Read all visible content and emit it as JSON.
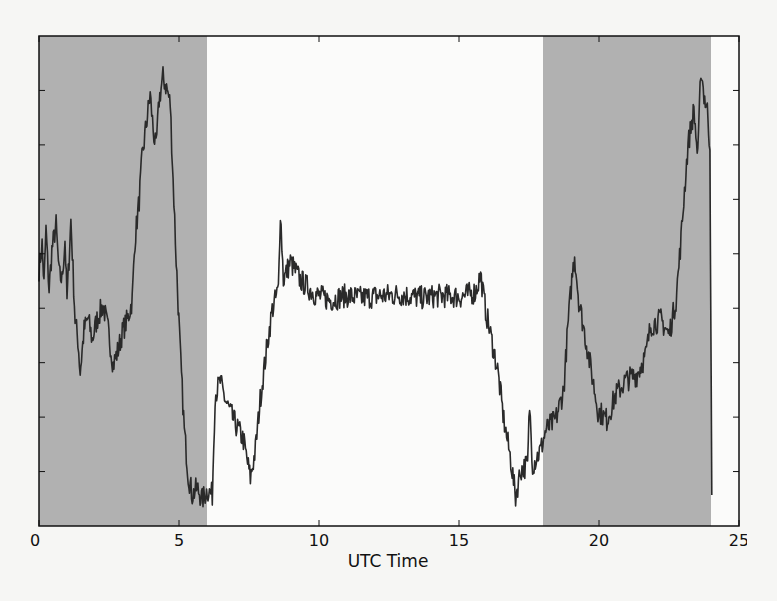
{
  "chart_data": {
    "type": "line",
    "title": "",
    "xlabel": "UTC Time",
    "ylabel": "",
    "xlim": [
      0,
      25
    ],
    "ylim": [
      0,
      9
    ],
    "xticks": [
      0,
      5,
      10,
      15,
      20,
      25
    ],
    "xtick_labels": [
      "0",
      "5",
      "10",
      "15",
      "20",
      "25"
    ],
    "yticks": [
      1,
      2,
      3,
      4,
      5,
      6,
      7,
      8
    ],
    "ytick_labels": [],
    "grid": false,
    "legend": null,
    "colors": {
      "line": "#2a2a2a",
      "shade": "#b1b1b1",
      "background": "#f6f6f4",
      "axes": "#111111"
    },
    "shaded_regions": [
      {
        "x_start": 0,
        "x_end": 6,
        "label": "night"
      },
      {
        "x_start": 18,
        "x_end": 24,
        "label": "night"
      }
    ],
    "noise_amplitude": 0.22,
    "series": [
      {
        "name": "signal",
        "x": [
          0,
          0.11,
          0.18,
          0.25,
          0.36,
          0.46,
          0.61,
          0.72,
          0.82,
          0.93,
          1.0,
          1.14,
          1.29,
          1.39,
          1.47,
          1.61,
          1.75,
          1.9,
          2.07,
          2.29,
          2.47,
          2.65,
          2.83,
          3.0,
          3.18,
          3.33,
          3.43,
          3.58,
          3.68,
          3.83,
          3.97,
          4.08,
          4.18,
          4.29,
          4.43,
          4.58,
          4.69,
          4.79,
          4.9,
          5.04,
          5.19,
          5.33,
          5.47,
          5.65,
          5.83,
          6.01,
          6.19,
          6.29,
          6.47,
          6.65,
          6.94,
          7.3,
          7.55,
          7.73,
          7.9,
          8.15,
          8.33,
          8.55,
          8.62,
          8.73,
          8.98,
          9.33,
          9.87,
          10.41,
          10.94,
          11.48,
          12.2,
          12.91,
          13.63,
          14.34,
          15.06,
          15.59,
          15.77,
          15.95,
          16.13,
          16.38,
          16.6,
          16.85,
          17.02,
          17.2,
          17.45,
          17.52,
          17.63,
          17.92,
          18.1,
          18.45,
          18.74,
          18.88,
          19.03,
          19.13,
          19.28,
          19.53,
          19.78,
          19.96,
          20.28,
          20.6,
          20.96,
          21.35,
          21.67,
          21.85,
          22.21,
          22.5,
          22.75,
          22.93,
          23.03,
          23.18,
          23.39,
          23.53,
          23.64,
          23.75,
          23.89,
          23.96,
          24.03
        ],
        "y": [
          4.71,
          5.17,
          4.43,
          5.44,
          4.34,
          5.07,
          5.53,
          4.61,
          4.52,
          5.26,
          4.15,
          5.63,
          3.79,
          3.42,
          2.83,
          3.6,
          3.82,
          3.42,
          3.79,
          4.06,
          3.6,
          2.96,
          3.24,
          3.6,
          3.82,
          4.15,
          5.26,
          5.99,
          6.73,
          7.37,
          7.92,
          7.28,
          6.91,
          7.83,
          8.24,
          8.01,
          7.74,
          6.36,
          4.89,
          3.24,
          1.76,
          0.94,
          0.57,
          0.7,
          0.48,
          0.66,
          0.57,
          2.41,
          2.65,
          2.32,
          1.95,
          1.58,
          0.88,
          1.4,
          2.32,
          3.33,
          3.97,
          4.34,
          5.81,
          4.52,
          4.85,
          4.52,
          4.25,
          4.15,
          4.23,
          4.19,
          4.23,
          4.25,
          4.19,
          4.23,
          4.21,
          4.3,
          4.61,
          3.97,
          3.51,
          2.87,
          1.95,
          1.21,
          0.53,
          1.03,
          1.12,
          2.22,
          1.12,
          1.4,
          1.76,
          1.95,
          2.5,
          3.6,
          4.52,
          4.98,
          4.15,
          3.42,
          2.68,
          2.13,
          1.95,
          2.41,
          2.68,
          2.78,
          3.14,
          3.69,
          3.79,
          3.51,
          4.15,
          5.26,
          5.99,
          7.0,
          7.65,
          6.73,
          8.42,
          7.92,
          7.56,
          6.91,
          0.57
        ]
      }
    ]
  }
}
